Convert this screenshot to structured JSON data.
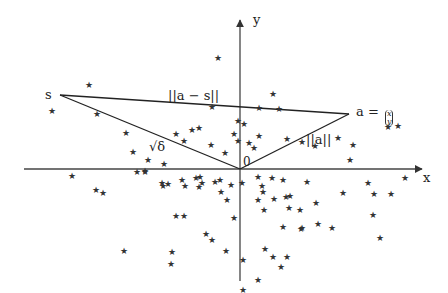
{
  "diagram": {
    "axes": {
      "x_label": "x",
      "y_label": "y",
      "origin_label": "0"
    },
    "points": {
      "s_label": "s",
      "a_label": "a =",
      "a_vector_top": "x",
      "a_vector_bottom": "y"
    },
    "edges": {
      "a_minus_s_label": "||a − s||",
      "sqrt_delta_label": "√δ",
      "norm_a_label": "||a||"
    },
    "colors": {
      "line": "#222222",
      "star": "#333333",
      "background": "#ffffff"
    },
    "stars": [
      [
        89,
        85
      ],
      [
        52,
        111
      ],
      [
        97,
        114
      ],
      [
        126,
        133
      ],
      [
        218,
        58
      ],
      [
        273,
        94
      ],
      [
        259,
        108
      ],
      [
        279,
        109
      ],
      [
        244,
        124
      ],
      [
        259,
        136
      ],
      [
        234,
        134
      ],
      [
        212,
        107
      ],
      [
        192,
        130
      ],
      [
        199,
        128
      ],
      [
        238,
        121
      ],
      [
        211,
        145
      ],
      [
        176,
        134
      ],
      [
        184,
        141
      ],
      [
        148,
        160
      ],
      [
        164,
        164
      ],
      [
        133,
        152
      ],
      [
        145,
        172
      ],
      [
        225,
        153
      ],
      [
        238,
        141
      ],
      [
        249,
        143
      ],
      [
        254,
        148
      ],
      [
        287,
        139
      ],
      [
        302,
        142
      ],
      [
        315,
        146
      ],
      [
        338,
        138
      ],
      [
        353,
        145
      ],
      [
        388,
        127
      ],
      [
        398,
        126
      ],
      [
        350,
        160
      ],
      [
        72,
        176
      ],
      [
        96,
        190
      ],
      [
        103,
        193
      ],
      [
        137,
        172
      ],
      [
        145,
        171
      ],
      [
        162,
        183
      ],
      [
        163,
        186
      ],
      [
        168,
        184
      ],
      [
        182,
        180
      ],
      [
        185,
        186
      ],
      [
        196,
        178
      ],
      [
        200,
        177
      ],
      [
        199,
        187
      ],
      [
        202,
        183
      ],
      [
        215,
        182
      ],
      [
        220,
        180
      ],
      [
        227,
        200
      ],
      [
        231,
        185
      ],
      [
        221,
        192
      ],
      [
        242,
        183
      ],
      [
        258,
        177
      ],
      [
        262,
        186
      ],
      [
        272,
        178
      ],
      [
        283,
        180
      ],
      [
        289,
        208
      ],
      [
        307,
        182
      ],
      [
        316,
        203
      ],
      [
        263,
        192
      ],
      [
        258,
        200
      ],
      [
        274,
        199
      ],
      [
        286,
        197
      ],
      [
        290,
        196
      ],
      [
        300,
        210
      ],
      [
        264,
        210
      ],
      [
        302,
        228
      ],
      [
        287,
        257
      ],
      [
        318,
        224
      ],
      [
        343,
        193
      ],
      [
        332,
        228
      ],
      [
        373,
        215
      ],
      [
        368,
        183
      ],
      [
        405,
        178
      ],
      [
        374,
        194
      ],
      [
        391,
        194
      ],
      [
        380,
        238
      ],
      [
        283,
        227
      ],
      [
        301,
        229
      ],
      [
        265,
        249
      ],
      [
        281,
        267
      ],
      [
        258,
        280
      ],
      [
        243,
        290
      ],
      [
        243,
        260
      ],
      [
        273,
        257
      ],
      [
        184,
        216
      ],
      [
        176,
        216
      ],
      [
        206,
        234
      ],
      [
        212,
        240
      ],
      [
        226,
        251
      ],
      [
        234,
        218
      ],
      [
        172,
        252
      ],
      [
        171,
        264
      ],
      [
        124,
        251
      ]
    ]
  }
}
